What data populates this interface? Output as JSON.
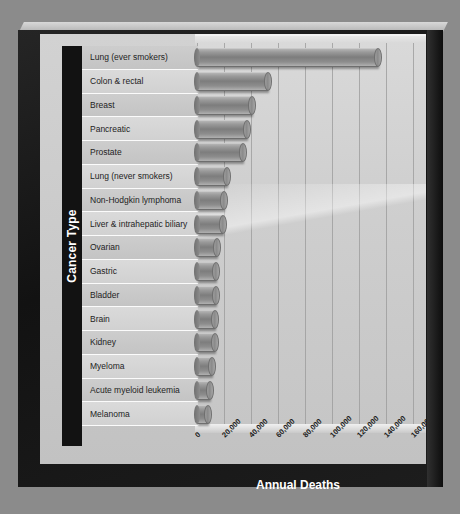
{
  "chart_data": {
    "type": "bar",
    "orientation": "horizontal",
    "title": "",
    "xlabel": "Annual Deaths",
    "ylabel": "Cancer Type",
    "xlim": [
      0,
      170000
    ],
    "xticks": [
      "0",
      "20,000",
      "40,000",
      "60,000",
      "80,000",
      "100,000",
      "120,000",
      "140,000",
      "160,000"
    ],
    "xtick_values": [
      0,
      20000,
      40000,
      60000,
      80000,
      100000,
      120000,
      140000,
      160000
    ],
    "grid": true,
    "legend": null,
    "categories": [
      "Lung (ever smokers)",
      "Colon & rectal",
      "Breast",
      "Pancreatic",
      "Prostate",
      "Lung (never smokers)",
      "Non-Hodgkin lymphoma",
      "Liver & intrahepatic biliary",
      "Ovarian",
      "Gastric",
      "Bladder",
      "Brain",
      "Kidney",
      "Myeloma",
      "Acute myeloid leukemia",
      "Melanoma"
    ],
    "values": [
      134000,
      53000,
      41000,
      37000,
      34000,
      22000,
      20000,
      19000,
      15000,
      14000,
      14000,
      13000,
      13000,
      11000,
      10000,
      8000
    ],
    "bar_style": "3d-cylinder",
    "bar_color": "#8d8d8d"
  },
  "axes": {
    "y_title": "Cancer Type",
    "x_title": "Annual Deaths"
  },
  "colors": {
    "frame": "#181818",
    "plot_background": "#cfcfcf",
    "bar": "#8d8d8d",
    "gridline": "#a0a0a0",
    "axis_title_text": "#ffffff",
    "category_text": "#232323",
    "page_background": "#8b8b8b"
  }
}
